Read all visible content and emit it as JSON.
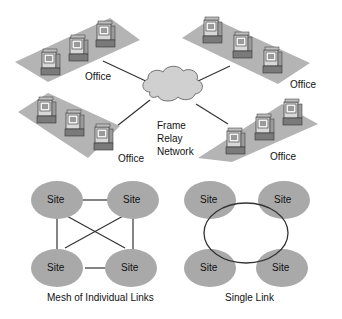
{
  "top_diagram": {
    "cloud_label_lines": [
      "Frame",
      "Relay",
      "Network"
    ],
    "offices": [
      {
        "label": "Office",
        "position": "top-left"
      },
      {
        "label": "Office",
        "position": "top-right"
      },
      {
        "label": "Office",
        "position": "bottom-left"
      },
      {
        "label": "Office",
        "position": "bottom-right"
      }
    ]
  },
  "mesh_diagram": {
    "caption": "Mesh of Individual Links",
    "sites": [
      "Site",
      "Site",
      "Site",
      "Site"
    ]
  },
  "single_link_diagram": {
    "caption": "Single Link",
    "sites": [
      "Site",
      "Site",
      "Site",
      "Site"
    ]
  },
  "colors": {
    "platform": "#b4b4b4",
    "site": "#a9a9a9",
    "cloud": "#d0d0d0",
    "line": "#333333"
  }
}
